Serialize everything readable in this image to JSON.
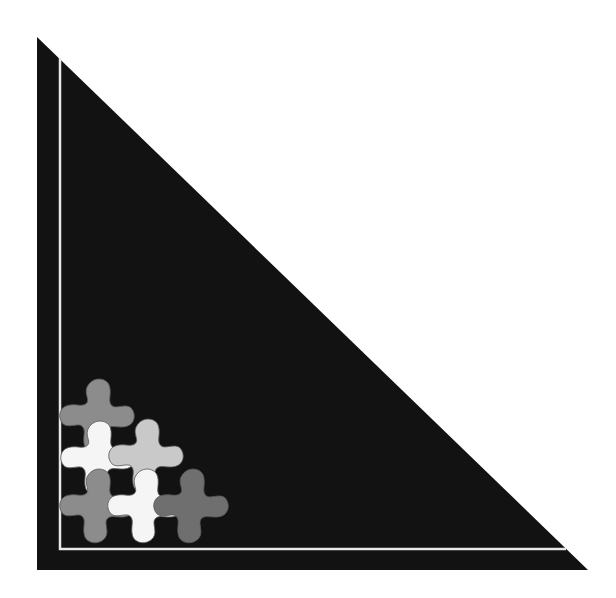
{
  "colors": {
    "background": "#ffffff",
    "triangle": "#121212",
    "border_line": "#e8e8e8",
    "tile_medium_gray": "#8c8c8c",
    "tile_light_gray": "#c9c9c9",
    "tile_white": "#f5f5f5",
    "tile_dark_gray": "#6f6f6f",
    "tile_outline": "#5a5a5a"
  },
  "triangle": {
    "top": [
      37,
      37
    ],
    "bottom_left": [
      37,
      570
    ],
    "bottom_right": [
      588,
      570
    ]
  },
  "border_line": {
    "top": [
      60,
      58
    ],
    "corner": [
      60,
      549
    ],
    "right": [
      566,
      549
    ]
  },
  "tiles": [
    {
      "name": "tile-medium-gray-top",
      "cx": 97,
      "cy": 418,
      "rotate": 0,
      "fill": "#8c8c8c"
    },
    {
      "name": "tile-white-left",
      "cx": 98,
      "cy": 460,
      "rotate": 0,
      "fill": "#f5f5f5"
    },
    {
      "name": "tile-light-gray",
      "cx": 146,
      "cy": 458,
      "rotate": 0,
      "fill": "#c9c9c9"
    },
    {
      "name": "tile-medium-gray-bottom",
      "cx": 97,
      "cy": 508,
      "rotate": 0,
      "fill": "#8c8c8c"
    },
    {
      "name": "tile-white-bottom",
      "cx": 145,
      "cy": 508,
      "rotate": 0,
      "fill": "#f5f5f5"
    },
    {
      "name": "tile-dark-gray-right",
      "cx": 191,
      "cy": 508,
      "rotate": 0,
      "fill": "#6f6f6f"
    }
  ]
}
